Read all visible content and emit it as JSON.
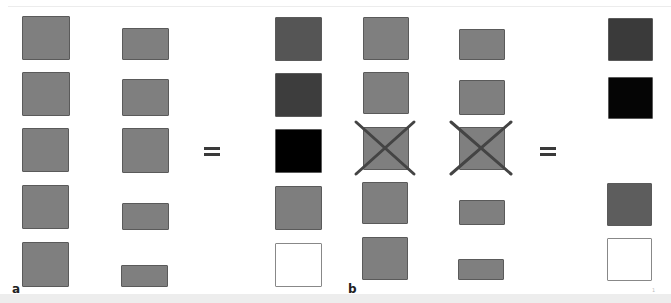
{
  "panels": [
    {
      "label": "a",
      "equals_sign": "=",
      "colors": {
        "input": "#7f7f7f",
        "border": "#5a5a5a"
      },
      "columns": {
        "left": [
          {
            "x": 22,
            "y": 16,
            "w": 48,
            "h": 44
          },
          {
            "x": 22,
            "y": 72,
            "w": 48,
            "h": 44
          },
          {
            "x": 22,
            "y": 128,
            "w": 47,
            "h": 44
          },
          {
            "x": 22,
            "y": 185,
            "w": 47,
            "h": 44
          },
          {
            "x": 22,
            "y": 242,
            "w": 47,
            "h": 45
          }
        ],
        "middle": [
          {
            "x": 122,
            "y": 28,
            "w": 47,
            "h": 32
          },
          {
            "x": 122,
            "y": 79,
            "w": 47,
            "h": 37
          },
          {
            "x": 122,
            "y": 128,
            "w": 47,
            "h": 45
          },
          {
            "x": 122,
            "y": 203,
            "w": 47,
            "h": 27
          },
          {
            "x": 121,
            "y": 265,
            "w": 47,
            "h": 22
          }
        ],
        "result": [
          {
            "x": 275,
            "y": 17,
            "w": 47,
            "h": 44,
            "color": "#555555"
          },
          {
            "x": 275,
            "y": 73,
            "w": 47,
            "h": 44,
            "color": "#3d3d3d"
          },
          {
            "x": 275,
            "y": 129,
            "w": 47,
            "h": 44,
            "color": "#000000"
          },
          {
            "x": 275,
            "y": 186,
            "w": 47,
            "h": 44,
            "color": "#7e7e7e"
          },
          {
            "x": 275,
            "y": 243,
            "w": 47,
            "h": 44,
            "color": "#ffffff",
            "border": "#888888"
          }
        ]
      },
      "equals_pos": {
        "x": 204,
        "y": 147
      },
      "label_pos": {
        "x": 12,
        "y": 283
      }
    },
    {
      "label": "b",
      "equals_sign": "=",
      "colors": {
        "input": "#7f7f7f",
        "border": "#5a5a5a",
        "cross": "#444444"
      },
      "columns": {
        "left": [
          {
            "x": 363,
            "y": 17,
            "w": 46,
            "h": 43
          },
          {
            "x": 363,
            "y": 72,
            "w": 46,
            "h": 42
          },
          {
            "x": 363,
            "y": 127,
            "w": 46,
            "h": 43,
            "crossed": true
          },
          {
            "x": 362,
            "y": 182,
            "w": 46,
            "h": 42
          },
          {
            "x": 362,
            "y": 237,
            "w": 46,
            "h": 43
          }
        ],
        "middle": [
          {
            "x": 459,
            "y": 29,
            "w": 46,
            "h": 31
          },
          {
            "x": 459,
            "y": 80,
            "w": 46,
            "h": 35
          },
          {
            "x": 459,
            "y": 127,
            "w": 46,
            "h": 43,
            "crossed": true
          },
          {
            "x": 459,
            "y": 200,
            "w": 46,
            "h": 25
          },
          {
            "x": 458,
            "y": 259,
            "w": 46,
            "h": 21
          }
        ],
        "result": [
          {
            "x": 608,
            "y": 18,
            "w": 45,
            "h": 43,
            "color": "#3a3a3a"
          },
          {
            "x": 608,
            "y": 77,
            "w": 45,
            "h": 42,
            "color": "#050505"
          },
          {
            "x": 607,
            "y": 183,
            "w": 45,
            "h": 43,
            "color": "#5d5d5d"
          },
          {
            "x": 607,
            "y": 238,
            "w": 45,
            "h": 43,
            "color": "#ffffff",
            "border": "#888888"
          }
        ]
      },
      "crosses": [
        {
          "x1": 356,
          "y1": 122,
          "x2": 414,
          "y2": 174
        },
        {
          "x1": 451,
          "y1": 122,
          "x2": 511,
          "y2": 174
        }
      ],
      "equals_pos": {
        "x": 540,
        "y": 147
      },
      "label_pos": {
        "x": 348,
        "y": 283
      }
    }
  ],
  "footer_mark": "1"
}
